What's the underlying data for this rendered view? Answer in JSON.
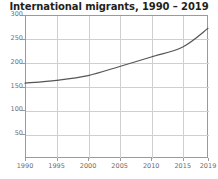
{
  "chart_data": {
    "type": "line",
    "title": "International migrants, 1990 – 2019",
    "subtitle": "",
    "xlabel": "",
    "ylabel": "",
    "x": [
      1990,
      1995,
      2000,
      2005,
      2010,
      2015,
      2019
    ],
    "series": [
      {
        "name": "International migrants",
        "values": [
          157,
          163,
          173,
          192,
          212,
          233,
          272
        ]
      }
    ],
    "xlim": [
      1990,
      2019
    ],
    "ylim": [
      0,
      300
    ],
    "xticks": [
      1990,
      1995,
      2000,
      2005,
      2010,
      2015,
      2019
    ],
    "xtick_labels": [
      "1990",
      "1995",
      "2000",
      "2005",
      "2010",
      "2015",
      "2019"
    ],
    "yticks": [
      50,
      100,
      150,
      200,
      250,
      300
    ],
    "ytick_labels": [
      "50",
      "100",
      "150",
      "200",
      "250",
      "300"
    ],
    "grid": true,
    "legend": false,
    "legend_position": "none",
    "line_color": "#555555",
    "grid_color": "#cfcfcf",
    "frame_color": "#9a9a9a",
    "tick_label_color": "#6d6d6d",
    "title_color": "#231f20",
    "background_color": "#ffffff"
  }
}
